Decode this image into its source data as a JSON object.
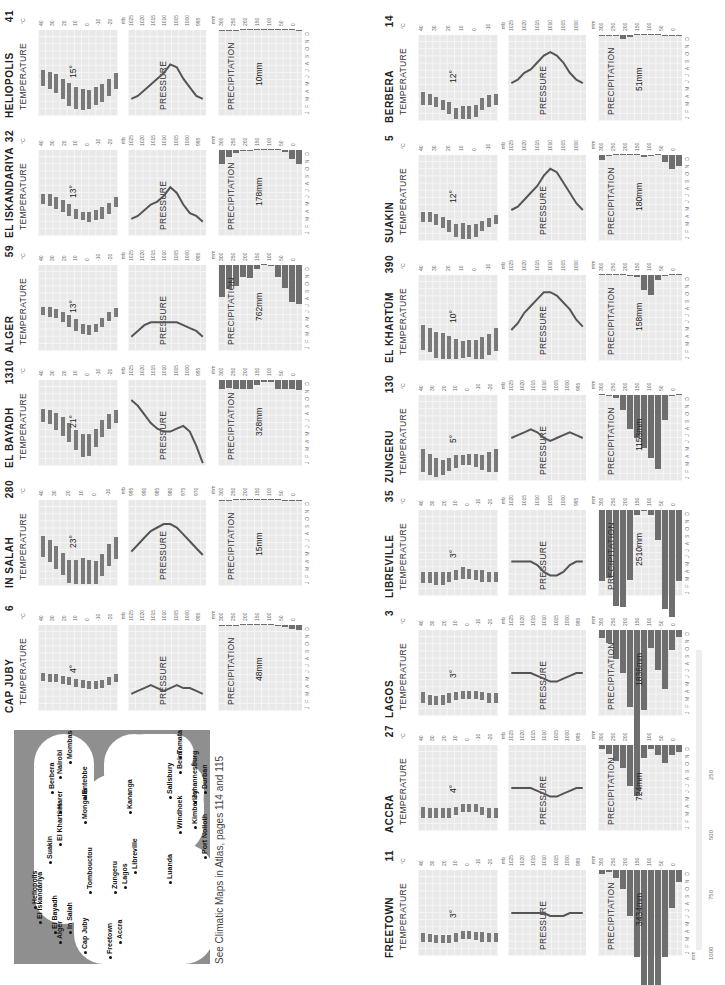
{
  "caption": "See Climatic Maps in Atlas, pages 114 and 115",
  "labels": {
    "temperature": "TEMPERATURE",
    "pressure": "PRESSURE",
    "precipitation": "PRECIPITATION",
    "unit_c": "°C",
    "unit_mb": "mb",
    "unit_mm": "mm",
    "months": [
      "J",
      "F",
      "M",
      "A",
      "M",
      "J",
      "J",
      "A",
      "S",
      "O",
      "N",
      "D"
    ]
  },
  "map": {
    "cities": [
      "Alger",
      "El Bayadh",
      "El Iskandariya",
      "Heliopolis",
      "In Salah",
      "Cap Juby",
      "Tombouctou",
      "Suakin",
      "El Khartûm",
      "Harer",
      "Berbera",
      "Freetown",
      "Accra",
      "Zungeru",
      "Lagos",
      "Mongalla",
      "Entebbe",
      "Nairobi",
      "Mombasa",
      "Libreville",
      "Luanda",
      "Kananga",
      "Tamatave",
      "Beira",
      "Salisbury",
      "Windhoek",
      "Kimberley",
      "Johannesburg",
      "Durban",
      "Port Nolloth",
      "Graaff-Reinet",
      "Cape Town"
    ]
  },
  "scale_bar": {
    "unit": "mm",
    "ticks": [
      "1000",
      "750",
      "500",
      "250"
    ]
  },
  "chart_data": [
    {
      "type": "bar",
      "title": "CAP JUBY",
      "elevation": "6",
      "temp_range_label": "4°",
      "precip_total": "48mm",
      "temp_axis": [
        "40",
        "30",
        "20",
        "10",
        "0",
        "-10",
        "-20"
      ],
      "pressure_axis": [
        "1025",
        "1020",
        "1015",
        "1010",
        "1005",
        "1000",
        "995"
      ],
      "precip_axis": [
        "300",
        "250",
        "200",
        "150",
        "100",
        "50",
        "0"
      ],
      "temp_min": [
        15,
        16,
        16,
        17,
        18,
        19,
        20,
        21,
        21,
        20,
        18,
        16
      ],
      "temp_max": [
        19,
        20,
        20,
        21,
        22,
        23,
        24,
        25,
        25,
        24,
        22,
        20
      ],
      "pressure": [
        1019,
        1018,
        1017,
        1016,
        1017,
        1018,
        1017,
        1016,
        1017,
        1017,
        1018,
        1019
      ],
      "precip": [
        5,
        3,
        2,
        1,
        0,
        0,
        0,
        0,
        2,
        6,
        13,
        16
      ]
    },
    {
      "type": "bar",
      "title": "IN SALAH",
      "elevation": "280",
      "temp_range_label": "23°",
      "precip_total": "15mm",
      "temp_axis": [
        "40",
        "30",
        "20",
        "10",
        "0",
        "-10"
      ],
      "pressure_axis": [
        "995",
        "990",
        "985",
        "980",
        "975",
        "970"
      ],
      "precip_axis": [
        "300",
        "250",
        "200",
        "150",
        "100",
        "50",
        "0"
      ],
      "temp_min": [
        5,
        8,
        12,
        17,
        22,
        26,
        28,
        27,
        24,
        18,
        11,
        6
      ],
      "temp_max": [
        20,
        23,
        28,
        32,
        38,
        43,
        46,
        44,
        40,
        33,
        26,
        21
      ],
      "pressure": [
        985,
        983,
        981,
        979,
        978,
        977,
        977,
        978,
        980,
        982,
        984,
        986
      ],
      "precip": [
        2,
        2,
        1,
        1,
        1,
        0,
        0,
        1,
        1,
        2,
        2,
        2
      ]
    },
    {
      "type": "bar",
      "title": "EL BAYADH",
      "elevation": "1310",
      "temp_range_label": "21°",
      "precip_total": "328mm",
      "temp_axis": [
        "40",
        "30",
        "20",
        "10",
        "0",
        "-10",
        "-20"
      ],
      "pressure_axis": [
        "1025",
        "1020",
        "1015",
        "1010",
        "1005",
        "1000",
        "995"
      ],
      "precip_axis": [
        "300",
        "250",
        "200",
        "150",
        "100",
        "50",
        "0"
      ],
      "temp_min": [
        0,
        1,
        3,
        6,
        10,
        15,
        18,
        18,
        14,
        8,
        4,
        1
      ],
      "temp_max": [
        9,
        11,
        15,
        19,
        23,
        29,
        34,
        33,
        27,
        20,
        14,
        10
      ],
      "pressure": [
        1002,
        1004,
        1007,
        1010,
        1012,
        1013,
        1013,
        1012,
        1011,
        1013,
        1018,
        1024
      ],
      "precip": [
        31,
        28,
        33,
        30,
        33,
        18,
        8,
        8,
        30,
        33,
        32,
        34
      ]
    },
    {
      "type": "bar",
      "title": "ALGER",
      "elevation": "59",
      "temp_range_label": "13°",
      "precip_total": "762mm",
      "temp_axis": [
        "40",
        "30",
        "20",
        "10",
        "0",
        "-10",
        "-20"
      ],
      "pressure_axis": [
        "1025",
        "1020",
        "1015",
        "1010",
        "1005",
        "1000",
        "995"
      ],
      "precip_axis": [
        "300",
        "250",
        "200",
        "150",
        "100",
        "50",
        "0"
      ],
      "temp_min": [
        9,
        9,
        11,
        13,
        15,
        18,
        21,
        22,
        21,
        17,
        13,
        10
      ],
      "temp_max": [
        15,
        16,
        17,
        20,
        23,
        26,
        28,
        29,
        27,
        23,
        19,
        16
      ],
      "pressure": [
        1020,
        1018,
        1016,
        1015,
        1015,
        1015,
        1015,
        1015,
        1016,
        1017,
        1018,
        1020
      ],
      "precip": [
        112,
        84,
        74,
        41,
        46,
        15,
        0,
        5,
        41,
        79,
        130,
        137
      ]
    },
    {
      "type": "bar",
      "title": "EL ISKANDARIYA",
      "elevation": "32",
      "temp_range_label": "13°",
      "precip_total": "178mm",
      "temp_axis": [
        "40",
        "30",
        "20",
        "10",
        "0",
        "-10",
        "-20"
      ],
      "pressure_axis": [
        "1025",
        "1020",
        "1015",
        "1010",
        "1005",
        "1000",
        "995"
      ],
      "precip_axis": [
        "300",
        "250",
        "200",
        "150",
        "100",
        "50",
        "0"
      ],
      "temp_min": [
        11,
        11,
        13,
        15,
        18,
        21,
        23,
        23,
        22,
        20,
        17,
        13
      ],
      "temp_max": [
        18,
        19,
        21,
        23,
        26,
        28,
        29,
        30,
        29,
        28,
        25,
        20
      ],
      "pressure": [
        1019,
        1018,
        1016,
        1014,
        1013,
        1011,
        1008,
        1010,
        1014,
        1017,
        1018,
        1020
      ],
      "precip": [
        48,
        25,
        10,
        3,
        2,
        0,
        0,
        0,
        1,
        8,
        33,
        48
      ]
    },
    {
      "type": "bar",
      "title": "HELIOPOLIS",
      "elevation": "41",
      "temp_range_label": "15°",
      "precip_total": "10mm",
      "temp_axis": [
        "40",
        "30",
        "20",
        "10",
        "0",
        "-10",
        "-20"
      ],
      "pressure_axis": [
        "1025",
        "1020",
        "1015",
        "1010",
        "1005",
        "1000",
        "995"
      ],
      "precip_axis": [
        "300",
        "250",
        "200",
        "150",
        "100",
        "50",
        "0"
      ],
      "temp_min": [
        8,
        9,
        11,
        14,
        17,
        20,
        21,
        22,
        20,
        18,
        14,
        10
      ],
      "temp_max": [
        19,
        21,
        24,
        28,
        33,
        35,
        36,
        35,
        32,
        30,
        26,
        21
      ],
      "pressure": [
        1019,
        1018,
        1016,
        1014,
        1012,
        1010,
        1007,
        1008,
        1012,
        1015,
        1018,
        1019
      ],
      "precip": [
        4,
        4,
        2,
        1,
        1,
        0,
        0,
        0,
        0,
        1,
        1,
        2
      ]
    },
    {
      "type": "bar",
      "title": "FREETOWN",
      "elevation": "11",
      "temp_range_label": "3°",
      "precip_total": "3434mm",
      "temp_axis": [
        "40",
        "30",
        "20",
        "10",
        "0",
        "-10",
        "-20"
      ],
      "pressure_axis": [
        "1025",
        "1020",
        "1015",
        "1010",
        "1005",
        "1000",
        "995"
      ],
      "precip_axis": [
        "300",
        "250",
        "200",
        "150",
        "100",
        "50",
        "0"
      ],
      "extended_precip_axis": [
        "1000",
        "750",
        "500",
        "250"
      ],
      "temp_min": [
        24,
        25,
        25,
        25,
        25,
        24,
        23,
        23,
        23,
        23,
        24,
        24
      ],
      "temp_max": [
        30,
        30,
        31,
        31,
        31,
        30,
        28,
        28,
        29,
        30,
        30,
        30
      ],
      "pressure": [
        1010,
        1010,
        1010,
        1010,
        1010,
        1010,
        1011,
        1011,
        1011,
        1010,
        1010,
        1010
      ],
      "precip": [
        13,
        8,
        28,
        66,
        160,
        302,
        894,
        902,
        610,
        302,
        132,
        41
      ]
    },
    {
      "type": "bar",
      "title": "ACCRA",
      "elevation": "27",
      "temp_range_label": "4°",
      "precip_total": "724mm",
      "temp_axis": [
        "40",
        "30",
        "20",
        "10",
        "0",
        "-10",
        "-20"
      ],
      "pressure_axis": [
        "1025",
        "1020",
        "1015",
        "1010",
        "1005",
        "1000",
        "995"
      ],
      "precip_axis": [
        "300",
        "250",
        "200",
        "150",
        "100",
        "50",
        "0"
      ],
      "temp_min": [
        23,
        24,
        24,
        24,
        24,
        23,
        23,
        22,
        23,
        23,
        24,
        24
      ],
      "temp_max": [
        31,
        31,
        31,
        31,
        31,
        29,
        27,
        27,
        27,
        29,
        31,
        31
      ],
      "pressure": [
        1010,
        1010,
        1010,
        1010,
        1011,
        1012,
        1013,
        1013,
        1012,
        1011,
        1010,
        1010
      ],
      "precip": [
        15,
        33,
        56,
        81,
        142,
        178,
        46,
        15,
        36,
        64,
        36,
        23
      ]
    },
    {
      "type": "bar",
      "title": "LAGOS",
      "elevation": "3",
      "temp_range_label": "3°",
      "precip_total": "1836mm",
      "temp_axis": [
        "40",
        "30",
        "20",
        "10",
        "0",
        "-10",
        "-20"
      ],
      "pressure_axis": [
        "1025",
        "1020",
        "1015",
        "1010",
        "1005",
        "1000",
        "995"
      ],
      "precip_axis": [
        "300",
        "250",
        "200",
        "150",
        "100",
        "50",
        "0"
      ],
      "temp_min": [
        23,
        25,
        26,
        25,
        24,
        23,
        23,
        23,
        23,
        23,
        24,
        24
      ],
      "temp_max": [
        31,
        32,
        32,
        32,
        31,
        29,
        28,
        28,
        28,
        29,
        31,
        31
      ],
      "pressure": [
        1010,
        1010,
        1010,
        1010,
        1011,
        1012,
        1013,
        1013,
        1012,
        1011,
        1010,
        1010
      ],
      "precip": [
        28,
        46,
        102,
        150,
        269,
        460,
        279,
        64,
        140,
        206,
        69,
        25
      ]
    },
    {
      "type": "bar",
      "title": "LIBREVILLE",
      "elevation": "35",
      "temp_range_label": "3°",
      "precip_total": "2510mm",
      "temp_axis": [
        "40",
        "30",
        "20",
        "10",
        "0",
        "-10",
        "-20"
      ],
      "pressure_axis": [
        "1020",
        "1015",
        "1010",
        "1005",
        "1000",
        "995"
      ],
      "precip_axis": [
        "300",
        "250",
        "200",
        "150",
        "100",
        "50",
        "0"
      ],
      "temp_min": [
        23,
        23,
        23,
        23,
        23,
        22,
        20,
        21,
        22,
        22,
        23,
        23
      ],
      "temp_max": [
        31,
        31,
        32,
        32,
        30,
        29,
        28,
        28,
        29,
        30,
        30,
        30
      ],
      "pressure": [
        1010,
        1010,
        1010,
        1010,
        1011,
        1013,
        1014,
        1014,
        1013,
        1011,
        1010,
        1010
      ],
      "precip": [
        249,
        236,
        335,
        340,
        244,
        18,
        3,
        18,
        104,
        345,
        373,
        249
      ]
    },
    {
      "type": "bar",
      "title": "ZUNGERU",
      "elevation": "130",
      "temp_range_label": "5°",
      "precip_total": "1153mm",
      "temp_axis": [
        "40",
        "30",
        "20",
        "10",
        "0",
        "-10",
        "-20"
      ],
      "pressure_axis": [
        "1025",
        "1020",
        "1015",
        "1010",
        "1005",
        "1000",
        "995"
      ],
      "precip_axis": [
        "300",
        "250",
        "200",
        "150",
        "100",
        "50",
        "0"
      ],
      "temp_min": [
        18,
        21,
        24,
        25,
        24,
        22,
        22,
        21,
        21,
        22,
        20,
        18
      ],
      "temp_max": [
        34,
        36,
        37,
        36,
        33,
        31,
        29,
        29,
        30,
        32,
        34,
        34
      ],
      "pressure": [
        1010,
        1009,
        1008,
        1007,
        1008,
        1010,
        1011,
        1010,
        1009,
        1008,
        1009,
        1010
      ],
      "precip": [
        0,
        3,
        10,
        53,
        117,
        150,
        185,
        221,
        259,
        86,
        3,
        0
      ]
    },
    {
      "type": "bar",
      "title": "EL KHARTŪM",
      "elevation": "390",
      "temp_range_label": "10°",
      "precip_total": "158mm",
      "temp_axis": [
        "40",
        "30",
        "20",
        "10",
        "0",
        "-10"
      ],
      "pressure_axis": [
        "1025",
        "1020",
        "1015",
        "1010",
        "1005",
        "1000"
      ],
      "precip_axis": [
        "300",
        "250",
        "200",
        "150",
        "100",
        "50",
        "0"
      ],
      "temp_min": [
        15,
        17,
        20,
        23,
        26,
        27,
        26,
        25,
        26,
        25,
        21,
        17
      ],
      "temp_max": [
        32,
        34,
        38,
        41,
        42,
        41,
        38,
        37,
        39,
        40,
        36,
        33
      ],
      "pressure": [
        1016,
        1014,
        1011,
        1009,
        1007,
        1005,
        1005,
        1006,
        1008,
        1010,
        1013,
        1015
      ],
      "precip": [
        0,
        0,
        0,
        0,
        3,
        8,
        53,
        71,
        18,
        5,
        0,
        0
      ]
    },
    {
      "type": "bar",
      "title": "SUAKIN",
      "elevation": "5",
      "temp_range_label": "12°",
      "precip_total": "180mm",
      "temp_axis": [
        "40",
        "30",
        "20",
        "10",
        "0",
        "-10"
      ],
      "pressure_axis": [
        "1025",
        "1020",
        "1015",
        "1010",
        "1005",
        "1000"
      ],
      "precip_axis": [
        "300",
        "250",
        "200",
        "150",
        "100",
        "50",
        "0"
      ],
      "temp_min": [
        20,
        20,
        21,
        23,
        25,
        28,
        29,
        30,
        28,
        26,
        24,
        22
      ],
      "temp_max": [
        27,
        27,
        29,
        31,
        34,
        37,
        40,
        40,
        37,
        33,
        30,
        28
      ],
      "pressure": [
        1016,
        1015,
        1013,
        1011,
        1009,
        1006,
        1004,
        1005,
        1008,
        1011,
        1014,
        1016
      ],
      "precip": [
        18,
        3,
        0,
        1,
        1,
        0,
        8,
        3,
        0,
        23,
        48,
        38
      ]
    },
    {
      "type": "bar",
      "title": "BERBERA",
      "elevation": "14",
      "temp_range_label": "12°",
      "precip_total": "51mm",
      "temp_axis": [
        "40",
        "30",
        "20",
        "10",
        "0",
        "-10"
      ],
      "pressure_axis": [
        "1025",
        "1020",
        "1015",
        "1010",
        "1005",
        "1000"
      ],
      "precip_axis": [
        "300",
        "250",
        "200",
        "150",
        "100",
        "50",
        "0"
      ],
      "temp_min": [
        20,
        21,
        23,
        25,
        27,
        31,
        32,
        32,
        29,
        24,
        22,
        21
      ],
      "temp_max": [
        29,
        29,
        30,
        32,
        35,
        39,
        41,
        41,
        37,
        32,
        30,
        29
      ],
      "pressure": [
        1014,
        1013,
        1011,
        1010,
        1008,
        1006,
        1005,
        1006,
        1008,
        1011,
        1013,
        1014
      ],
      "precip": [
        3,
        3,
        5,
        13,
        8,
        0,
        1,
        1,
        1,
        3,
        5,
        3
      ]
    }
  ]
}
